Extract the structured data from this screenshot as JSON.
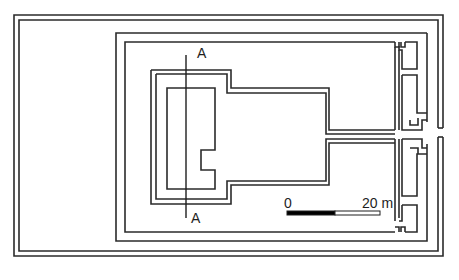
{
  "diagram": {
    "type": "architectural-plan",
    "section_line": {
      "label_top": "A",
      "label_bottom": "A"
    },
    "scale_bar": {
      "start_label": "0",
      "end_label": "20 m",
      "fill_color": "#000000",
      "empty_color": "#ffffff"
    },
    "colors": {
      "wall": "#2b2b2b",
      "background": "#ffffff"
    }
  }
}
